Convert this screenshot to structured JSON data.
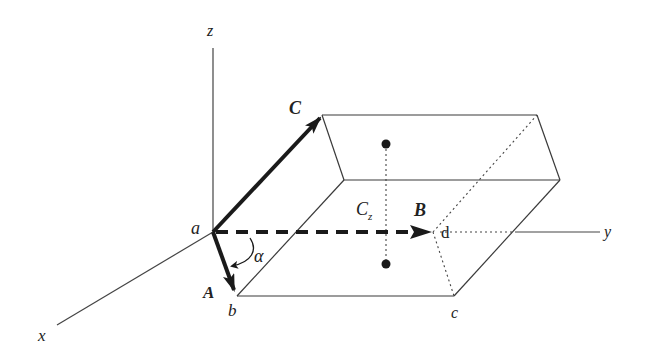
{
  "diagram": {
    "type": "3D box with vectors and coordinate axes",
    "axes": {
      "x": "x",
      "y": "y",
      "z": "z"
    },
    "vertices": {
      "a": "a",
      "b": "b",
      "c": "c",
      "d": "d"
    },
    "vectors": {
      "A": "A",
      "B": "B",
      "C": "C"
    },
    "angle": "α",
    "center_label": "C",
    "center_subscript": "z",
    "colors": {
      "line": "#3a3a3a",
      "vector": "#1a1a1a",
      "background": "#ffffff"
    }
  }
}
